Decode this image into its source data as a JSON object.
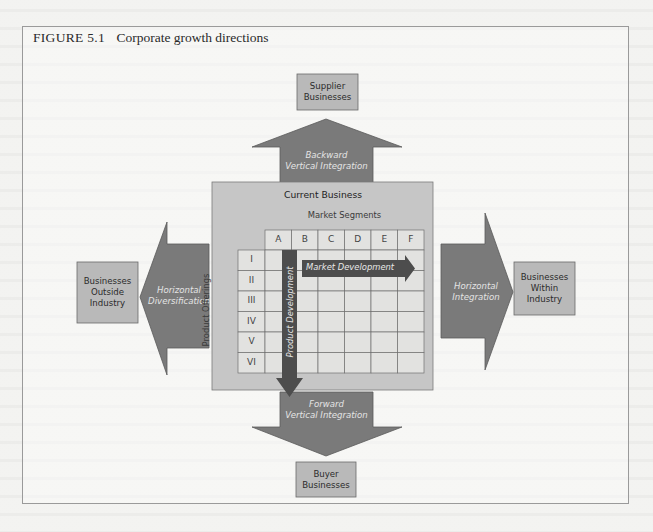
{
  "figure": {
    "number": "FIGURE 5.1",
    "title": "Corporate growth directions"
  },
  "current_business": {
    "title": "Current Business",
    "columns_title": "Market Segments",
    "rows_title": "Product Offerings",
    "columns": [
      "A",
      "B",
      "C",
      "D",
      "E",
      "F"
    ],
    "rows": [
      "I",
      "II",
      "III",
      "IV",
      "V",
      "VI"
    ],
    "inner_arrows": {
      "market_development": "Market Development",
      "product_development": "Product Development"
    }
  },
  "directions": {
    "backward": {
      "arrow_label_line1": "Backward",
      "arrow_label_line2": "Vertical Integration",
      "target_line1": "Supplier",
      "target_line2": "Businesses"
    },
    "forward": {
      "arrow_label_line1": "Forward",
      "arrow_label_line2": "Vertical Integration",
      "target_line1": "Buyer",
      "target_line2": "Businesses"
    },
    "diversification": {
      "arrow_label_line1": "Horizontal",
      "arrow_label_line2": "Diversification",
      "target_line1": "Businesses",
      "target_line2": "Outside",
      "target_line3": "Industry"
    },
    "integration": {
      "arrow_label_line1": "Horizontal",
      "arrow_label_line2": "Integration",
      "target_line1": "Businesses",
      "target_line2": "Within",
      "target_line3": "Industry"
    }
  },
  "colors": {
    "arrow_fill": "#7a7a7a",
    "arrow_stroke": "#5a5a5a",
    "box_fill": "#b9b9b9",
    "current_business_fill": "#c6c6c6",
    "grid_fill": "#e2e2e0",
    "inner_arrow_fill": "#4d4d4d"
  }
}
